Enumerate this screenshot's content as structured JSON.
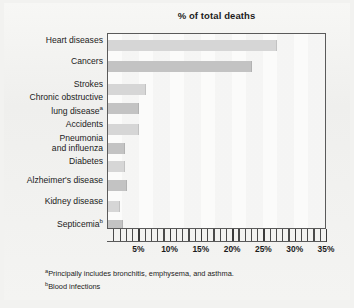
{
  "chart_data": {
    "type": "bar",
    "orientation": "horizontal",
    "title": "% of total deaths",
    "xlabel": "",
    "ylabel": "",
    "xlim": [
      0,
      35
    ],
    "xtick_values": [
      5,
      10,
      15,
      20,
      25,
      30,
      35
    ],
    "xtick_labels": [
      "5%",
      "10%",
      "15%",
      "20%",
      "25%",
      "30%",
      "35%"
    ],
    "minor_tick_step": 1,
    "grid": false,
    "legend": null,
    "categories": [
      "Heart diseases",
      "Cancers",
      "Strokes",
      "Chronic obstructive\nlung diseaseᵃ",
      "Accidents",
      "Pneumonia\nand influenza",
      "Diabetes",
      "Alzheimer's disease",
      "Kidney disease",
      "Septicemiaᵇ"
    ],
    "values": [
      27.0,
      23.0,
      6.0,
      5.0,
      5.0,
      2.7,
      2.7,
      3.0,
      1.9,
      2.4
    ],
    "bar_colors": [
      "#d6d6d6",
      "#c3c3c3",
      "#d6d6d6",
      "#c3c3c3",
      "#d6d6d6",
      "#c3c3c3",
      "#d6d6d6",
      "#c3c3c3",
      "#d6d6d6",
      "#c3c3c3"
    ]
  },
  "axis_labels": [
    {
      "line1": "Heart diseases",
      "line2": "",
      "sup": ""
    },
    {
      "line1": "Cancers",
      "line2": "",
      "sup": ""
    },
    {
      "line1": "Strokes",
      "line2": "",
      "sup": ""
    },
    {
      "line1": "Chronic obstructive",
      "line2": "lung disease",
      "sup": "a"
    },
    {
      "line1": "Accidents",
      "line2": "",
      "sup": ""
    },
    {
      "line1": "Pneumonia",
      "line2": "and influenza",
      "sup": ""
    },
    {
      "line1": "Diabetes",
      "line2": "",
      "sup": ""
    },
    {
      "line1": "Alzheimer's disease",
      "line2": "",
      "sup": ""
    },
    {
      "line1": "Kidney disease",
      "line2": "",
      "sup": ""
    },
    {
      "line1": "Septicemia",
      "line2": "",
      "sup": "b"
    }
  ],
  "footnotes": [
    {
      "marker": "a",
      "text": "Principally includes bronchitis, emphysema, and asthma."
    },
    {
      "marker": "b",
      "text": "Blood infections"
    }
  ],
  "colors": {
    "page_background": "#f2f2f0",
    "plot_background": "#fbfbfa",
    "frame": "#5a5a5a",
    "text": "#1b1b1b",
    "bar_light": "#d6d6d6",
    "bar_dark": "#c3c3c3"
  }
}
